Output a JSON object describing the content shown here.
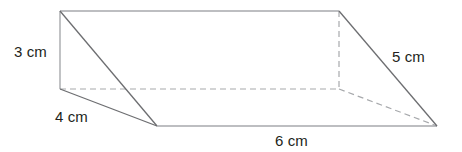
{
  "figure": {
    "name": "triangular-prism",
    "background_color": "#ffffff",
    "solid_edge_color": "#6d6e71",
    "light_edge_color": "#a7a9ac",
    "hidden_edge_color": "#a7a9ac",
    "label_color": "#231f20"
  },
  "labels": {
    "height": "3 cm",
    "base": "4 cm",
    "length": "6 cm",
    "slant": "5 cm"
  },
  "chart_data": {
    "type": "diagram",
    "title": "",
    "shape": "triangular prism",
    "projection": "oblique",
    "vertices": {
      "back_top_left": [
        60,
        11
      ],
      "back_top_right": [
        339,
        11
      ],
      "back_bottom_left": [
        60,
        89
      ],
      "back_bottom_right": [
        339,
        89
      ],
      "front_bottom_left": [
        157,
        126
      ],
      "front_bottom_right": [
        437,
        126
      ]
    },
    "solid_edges": [
      [
        "back_top_left",
        "back_top_right"
      ],
      [
        "back_top_left",
        "back_bottom_left"
      ],
      [
        "back_top_left",
        "front_bottom_left"
      ],
      [
        "back_bottom_left",
        "front_bottom_left"
      ],
      [
        "front_bottom_left",
        "front_bottom_right"
      ],
      [
        "back_top_right",
        "front_bottom_right"
      ]
    ],
    "dashed_edges": [
      [
        "back_bottom_left",
        "back_bottom_right"
      ],
      [
        "back_top_right",
        "back_bottom_right"
      ],
      [
        "back_bottom_right",
        "front_bottom_right"
      ]
    ],
    "dimensions": [
      {
        "label": "3 cm",
        "measures": "vertical height of triangular face",
        "value": 3,
        "unit": "cm"
      },
      {
        "label": "4 cm",
        "measures": "base of triangular face",
        "value": 4,
        "unit": "cm"
      },
      {
        "label": "6 cm",
        "measures": "length of prism",
        "value": 6,
        "unit": "cm"
      },
      {
        "label": "5 cm",
        "measures": "slant edge of triangular face",
        "value": 5,
        "unit": "cm"
      }
    ]
  }
}
